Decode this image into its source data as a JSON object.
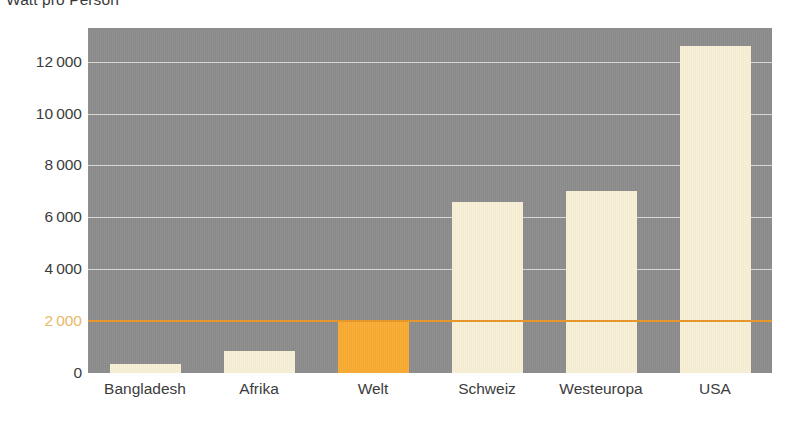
{
  "chart_data": {
    "type": "bar",
    "title": "Watt pro Person",
    "xlabel": "",
    "ylabel": "",
    "categories": [
      "Bangladesh",
      "Afrika",
      "Welt",
      "Schweiz",
      "Westeuropa",
      "USA"
    ],
    "values": [
      350,
      850,
      2000,
      6600,
      7000,
      12600
    ],
    "ylim": [
      0,
      13300
    ],
    "yticks": [
      0,
      2000,
      4000,
      6000,
      8000,
      10000,
      12000
    ],
    "ytick_labels": [
      "0",
      "2000",
      "4000",
      "6000",
      "8000",
      "10000",
      "12000"
    ],
    "highlight_category": "Welt",
    "highlight_value": 2000,
    "grid": true,
    "legend": "none",
    "colors": {
      "plot_background": "#8c8c8c",
      "bar": "#f7efd5",
      "bar_accent": "#f9ab33",
      "gridline": "#d8d8d4",
      "gridline_highlight": "#e8972a",
      "text": "#3c3c3c",
      "text_highlight": "#e8b868"
    }
  }
}
